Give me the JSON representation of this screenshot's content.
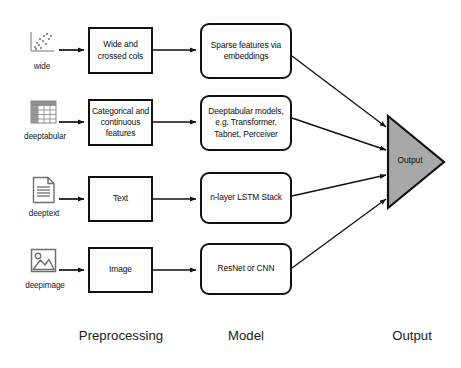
{
  "diagram": {
    "colors": {
      "stroke": "#111111",
      "fill": "#ffffff",
      "output_fill": "#a8a8a8",
      "text": "#1a1a1a"
    },
    "sources": [
      {
        "label": "wide",
        "icon": "scatter-plot-icon"
      },
      {
        "label": "deeptabular",
        "icon": "table-grid-icon"
      },
      {
        "label": "deeptext",
        "icon": "document-icon"
      },
      {
        "label": "deepimage",
        "icon": "image-icon"
      }
    ],
    "preprocessing": [
      {
        "label": "Wide and crossed cols"
      },
      {
        "label": "Categorical and continuous features"
      },
      {
        "label": "Text"
      },
      {
        "label": "Image"
      }
    ],
    "models": [
      {
        "label": "Sparse features via embeddings"
      },
      {
        "label": "Deeptabular models, e.g. Transformer, Tabnet, Perceiver"
      },
      {
        "label": "n-layer LSTM Stack"
      },
      {
        "label": "ResNet or CNN"
      }
    ],
    "output": {
      "label": "Output",
      "shape": "triangle-right"
    },
    "column_labels": [
      {
        "label": "Preprocessing"
      },
      {
        "label": "Model"
      },
      {
        "label": "Output"
      }
    ]
  }
}
